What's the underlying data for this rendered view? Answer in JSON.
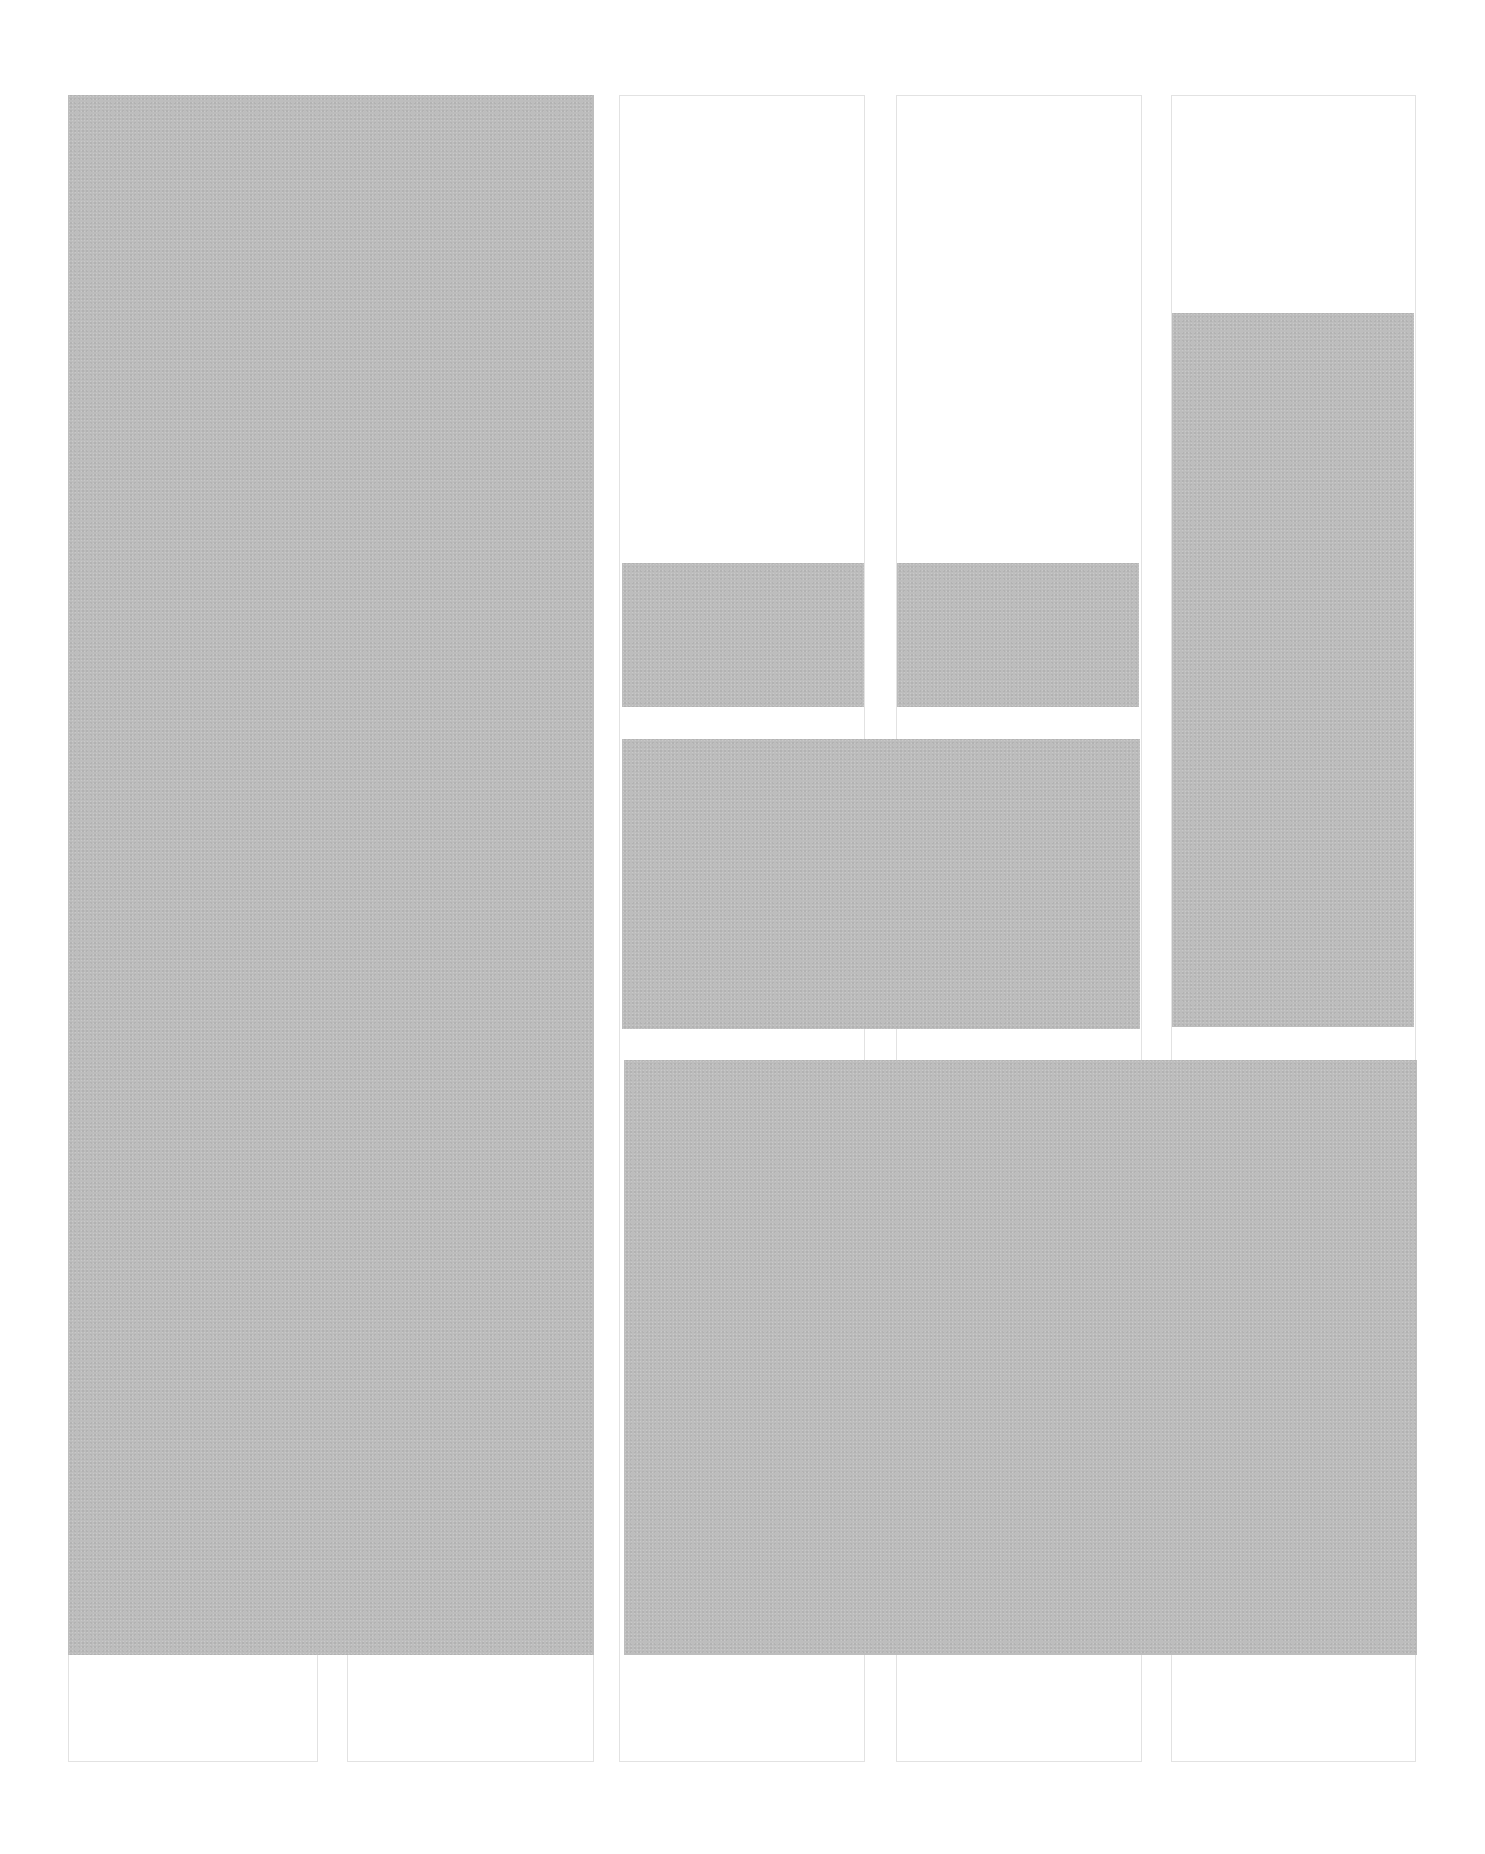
{
  "diagram": {
    "type": "column-grid-layout",
    "background": "#ffffff",
    "column_border_color": "#e2e2e2",
    "block_color": "#bdbdbd",
    "columns": [
      {
        "x": 68,
        "y": 95,
        "w": 250,
        "h": 1667
      },
      {
        "x": 347,
        "y": 95,
        "w": 247,
        "h": 1667
      },
      {
        "x": 619,
        "y": 95,
        "w": 246,
        "h": 1667
      },
      {
        "x": 896,
        "y": 95,
        "w": 246,
        "h": 1667
      },
      {
        "x": 1171,
        "y": 95,
        "w": 245,
        "h": 1667
      }
    ],
    "blocks": [
      {
        "name": "block-large-left",
        "x": 68,
        "y": 95,
        "w": 526,
        "h": 1560
      },
      {
        "name": "block-small-col3",
        "x": 622,
        "y": 563,
        "w": 242,
        "h": 144
      },
      {
        "name": "block-small-col4",
        "x": 897,
        "y": 563,
        "w": 242,
        "h": 144
      },
      {
        "name": "block-tall-col5",
        "x": 1172,
        "y": 313,
        "w": 242,
        "h": 714
      },
      {
        "name": "block-medium-wide",
        "x": 622,
        "y": 739,
        "w": 518,
        "h": 290
      },
      {
        "name": "block-large-bottom-right",
        "x": 624,
        "y": 1060,
        "w": 793,
        "h": 595
      }
    ]
  }
}
